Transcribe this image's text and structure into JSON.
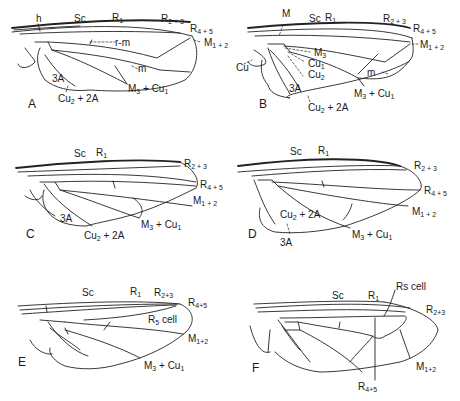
{
  "figure": {
    "stroke_color": "#222222",
    "background": "#ffffff"
  },
  "panels": {
    "A": {
      "letter": "A",
      "labels": {
        "h": "h",
        "sc": "Sc",
        "r1": "R1",
        "r23": "R2 + 3",
        "r45": "R4 + 5",
        "rm": "r-m",
        "m12": "M1 + 2",
        "m": "m",
        "a3": "3A",
        "cu2a2": "Cu2 + 2A",
        "m3cu1": "M3 + Cu1"
      }
    },
    "B": {
      "letter": "B",
      "labels": {
        "m_top": "M",
        "sc": "Sc",
        "r1": "R1",
        "r23": "R2 + 3",
        "r45": "R4 + 5",
        "m12": "M1 + 2",
        "m3": "M3",
        "cu1": "Cu1",
        "cu": "Cu",
        "cu2": "Cu2",
        "m": "m",
        "a3": "3A",
        "m3cu1": "M3 + Cu1",
        "cu2a2": "Cu2 + 2A"
      }
    },
    "C": {
      "letter": "C",
      "labels": {
        "sc": "Sc",
        "r1": "R1",
        "r23": "R2 + 3",
        "r45": "R4 + 5",
        "m12": "M1 + 2",
        "a3": "3A",
        "m3cu1": "M3 + Cu1",
        "cu2a2": "Cu2 + 2A"
      }
    },
    "D": {
      "letter": "D",
      "labels": {
        "sc": "Sc",
        "r1": "R1",
        "r23": "R2 + 3",
        "r45": "R4 + 5",
        "m12": "M1 + 2",
        "cu2a2": "Cu2 + 2A",
        "a3": "3A",
        "m3cu1": "M3 + Cu1"
      }
    },
    "E": {
      "letter": "E",
      "labels": {
        "sc": "Sc",
        "r1": "R1",
        "r23": "R2+3",
        "r45": "R4+5",
        "r5cell": "R5 cell",
        "m12": "M1+2",
        "m3cu1": "M3 + Cu1"
      }
    },
    "F": {
      "letter": "F",
      "labels": {
        "rscell": "Rs cell",
        "sc": "Sc",
        "r1": "R1",
        "r23": "R2+3",
        "m12": "M1+2",
        "r45": "R4+5"
      }
    }
  }
}
